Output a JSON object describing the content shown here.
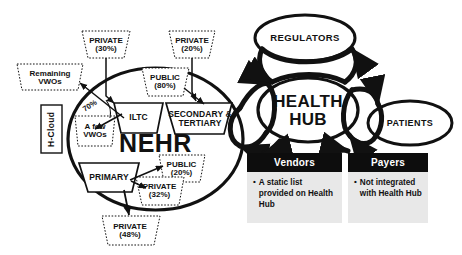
{
  "diagram": {
    "core": {
      "label": "NEHR",
      "sectors": [
        {
          "id": "iltc",
          "label": "ILTC"
        },
        {
          "id": "secondary-tertiary",
          "label": "SECONDARY & TERTIARY"
        },
        {
          "id": "primary",
          "label": "PRIMARY"
        }
      ]
    },
    "hub": {
      "label": "HEALTH HUB",
      "line1": "HEALTH",
      "line2": "HUB"
    },
    "nodes": [
      {
        "id": "regulators",
        "label": "REGULATORS"
      },
      {
        "id": "patients",
        "label": "PATIENTS"
      }
    ],
    "side_label": {
      "id": "h-cloud",
      "label": "H-Cloud"
    },
    "annotations": [
      {
        "id": "private-30",
        "line1": "PRIVATE",
        "line2": "(30%)",
        "for": "iltc"
      },
      {
        "id": "private-20",
        "line1": "PRIVATE",
        "line2": "(20%)",
        "for": "secondary-tertiary"
      },
      {
        "id": "public-80",
        "line1": "PUBLIC",
        "line2": "(80%)",
        "for": "secondary-tertiary"
      },
      {
        "id": "public-20",
        "line1": "PUBLIC",
        "line2": "(20%)",
        "for": "primary"
      },
      {
        "id": "private-32",
        "line1": "PRIVATE",
        "line2": "(32%)",
        "for": "primary"
      },
      {
        "id": "private-48",
        "line1": "PRIVATE",
        "line2": "(48%)",
        "for": "primary"
      },
      {
        "id": "remaining-vwos",
        "line1": "Remaining",
        "line2": "VWOs",
        "for": "iltc"
      },
      {
        "id": "a-few-vwos",
        "line1": "A few",
        "line2": "VWOs",
        "for": "iltc"
      }
    ],
    "edge_labels": [
      {
        "id": "seventy-percent",
        "label": "70%"
      }
    ],
    "cards": [
      {
        "id": "vendors",
        "title": "Vendors",
        "bullet": "•",
        "text": "A static list provided on Health Hub"
      },
      {
        "id": "payers",
        "title": "Payers",
        "bullet": "•",
        "text": "Not integrated with Health Hub"
      }
    ],
    "colors": {
      "ink": "#111111",
      "card_header_bg": "#0d0d0d",
      "card_header_fg": "#ffffff",
      "card_body_bg": "#e8e8e8",
      "canvas": "#ffffff"
    }
  }
}
